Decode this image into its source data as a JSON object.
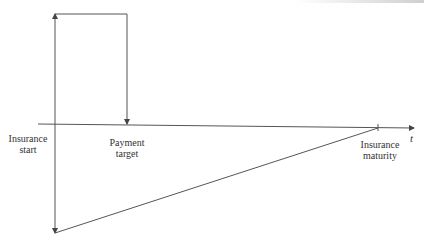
{
  "diagram": {
    "type": "cash-flow timeline",
    "axis": {
      "label": "t"
    },
    "labels": {
      "insurance_start": "Insurance\nstart",
      "payment_target": "Payment\ntarget",
      "insurance_maturity": "Insurance\nmaturity"
    },
    "labels_lines": {
      "insurance_start": [
        "Insurance",
        "start"
      ],
      "payment_target": [
        "Payment",
        "target"
      ],
      "insurance_maturity": [
        "Insurance",
        "maturity"
      ]
    },
    "colors": {
      "line": "#555555",
      "text": "#333333",
      "background": "#ffffff"
    }
  }
}
